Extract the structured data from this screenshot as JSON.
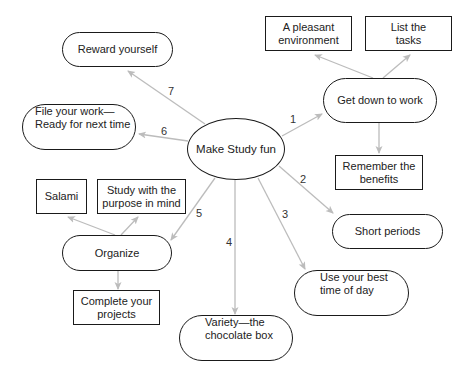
{
  "center": {
    "label": "Make Study fun"
  },
  "branches": [
    {
      "number": "1",
      "label": "Get down to work",
      "children": [
        "A pleasant environment",
        "List the tasks",
        "Remember the benefits"
      ]
    },
    {
      "number": "2",
      "label": "Short periods"
    },
    {
      "number": "3",
      "label": "Use your best time of day"
    },
    {
      "number": "4",
      "label": "Variety—the chocolate box"
    },
    {
      "number": "5",
      "label": "Organize",
      "children": [
        "Salami",
        "Study with the purpose in mind",
        "Complete your projects"
      ]
    },
    {
      "number": "6",
      "label": "File your work— Ready for next time"
    },
    {
      "number": "7",
      "label": "Reward yourself"
    }
  ],
  "nodes": {
    "center": "Make Study fun",
    "get_down": "Get down to work",
    "pleasant_env": [
      "A pleasant",
      "environment"
    ],
    "list_tasks": [
      "List the",
      "tasks"
    ],
    "remember": [
      "Remember the",
      "benefits"
    ],
    "short_periods": "Short periods",
    "best_time": [
      "Use your best",
      "time of day"
    ],
    "variety": [
      "Variety—the",
      "chocolate box"
    ],
    "organize": "Organize",
    "salami": "Salami",
    "study_purpose": [
      "Study with the",
      "purpose in mind"
    ],
    "complete": [
      "Complete your",
      "projects"
    ],
    "file_work": [
      "File your work—",
      "Ready for next time"
    ],
    "reward": "Reward yourself"
  },
  "arrow_labels": {
    "a1": "1",
    "a2": "2",
    "a3": "3",
    "a4": "4",
    "a5": "5",
    "a6": "6",
    "a7": "7"
  },
  "colors": {
    "arrow": "#bcbcbc",
    "border": "#1a1a1a",
    "background": "#ffffff"
  }
}
